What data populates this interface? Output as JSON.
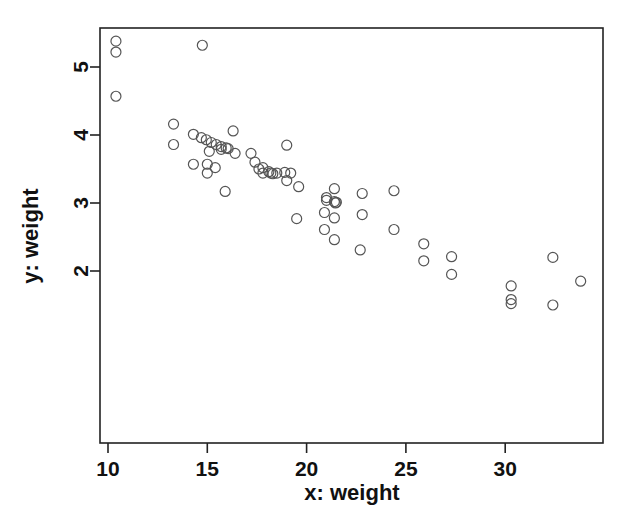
{
  "chart_data": {
    "type": "scatter",
    "title": "",
    "xlabel": "x: weight",
    "ylabel": "y: weight",
    "xlim": [
      9.2,
      34.9
    ],
    "ylim": [
      1.38,
      5.5
    ],
    "xticks": [
      10,
      15,
      20,
      25,
      30
    ],
    "yticks": [
      2,
      3,
      4,
      5
    ],
    "xtick_labels": [
      "10",
      "15",
      "20",
      "25",
      "30"
    ],
    "ytick_labels": [
      "2",
      "3",
      "4",
      "5"
    ],
    "grid": false,
    "legend": null,
    "marker": {
      "shape": "circle-open",
      "size": 5,
      "edge_color": "#555555",
      "fill": "none",
      "line_width": 1.2
    },
    "frame": {
      "box": true,
      "color": "#222222",
      "line_width": 1.6
    },
    "n_points": 63,
    "points": [
      {
        "x": 10.4,
        "y": 5.38
      },
      {
        "x": 10.4,
        "y": 5.22
      },
      {
        "x": 10.4,
        "y": 4.57
      },
      {
        "x": 14.75,
        "y": 5.32
      },
      {
        "x": 13.3,
        "y": 4.16
      },
      {
        "x": 13.3,
        "y": 3.86
      },
      {
        "x": 14.3,
        "y": 4.01
      },
      {
        "x": 14.7,
        "y": 3.96
      },
      {
        "x": 14.95,
        "y": 3.93
      },
      {
        "x": 15.2,
        "y": 3.89
      },
      {
        "x": 15.45,
        "y": 3.86
      },
      {
        "x": 15.7,
        "y": 3.83
      },
      {
        "x": 15.95,
        "y": 3.81
      },
      {
        "x": 16.3,
        "y": 4.06
      },
      {
        "x": 15.1,
        "y": 3.76
      },
      {
        "x": 15.7,
        "y": 3.79
      },
      {
        "x": 16.4,
        "y": 3.73
      },
      {
        "x": 17.2,
        "y": 3.73
      },
      {
        "x": 19.0,
        "y": 3.85
      },
      {
        "x": 14.3,
        "y": 3.57
      },
      {
        "x": 15.0,
        "y": 3.57
      },
      {
        "x": 15.4,
        "y": 3.52
      },
      {
        "x": 15.0,
        "y": 3.44
      },
      {
        "x": 15.9,
        "y": 3.17
      },
      {
        "x": 17.4,
        "y": 3.6
      },
      {
        "x": 17.8,
        "y": 3.52
      },
      {
        "x": 17.8,
        "y": 3.44
      },
      {
        "x": 18.1,
        "y": 3.46
      },
      {
        "x": 18.2,
        "y": 3.44
      },
      {
        "x": 18.5,
        "y": 3.44
      },
      {
        "x": 18.9,
        "y": 3.45
      },
      {
        "x": 19.0,
        "y": 3.33
      },
      {
        "x": 19.6,
        "y": 3.24
      },
      {
        "x": 19.5,
        "y": 2.77
      },
      {
        "x": 21.0,
        "y": 3.08
      },
      {
        "x": 21.0,
        "y": 3.04
      },
      {
        "x": 21.4,
        "y": 3.21
      },
      {
        "x": 21.4,
        "y": 3.02
      },
      {
        "x": 21.5,
        "y": 3.01
      },
      {
        "x": 20.9,
        "y": 2.86
      },
      {
        "x": 21.4,
        "y": 2.78
      },
      {
        "x": 20.9,
        "y": 2.61
      },
      {
        "x": 21.4,
        "y": 2.46
      },
      {
        "x": 22.8,
        "y": 3.14
      },
      {
        "x": 22.8,
        "y": 2.83
      },
      {
        "x": 22.7,
        "y": 2.31
      },
      {
        "x": 24.4,
        "y": 3.18
      },
      {
        "x": 24.4,
        "y": 2.61
      },
      {
        "x": 25.9,
        "y": 2.4
      },
      {
        "x": 25.9,
        "y": 2.15
      },
      {
        "x": 27.3,
        "y": 2.21
      },
      {
        "x": 27.3,
        "y": 1.95
      },
      {
        "x": 30.3,
        "y": 1.78
      },
      {
        "x": 30.3,
        "y": 1.58
      },
      {
        "x": 30.3,
        "y": 1.52
      },
      {
        "x": 32.4,
        "y": 2.2
      },
      {
        "x": 32.4,
        "y": 1.5
      },
      {
        "x": 33.8,
        "y": 1.85
      },
      {
        "x": 18.3,
        "y": 3.43
      },
      {
        "x": 19.2,
        "y": 3.44
      },
      {
        "x": 21.45,
        "y": 3.0
      },
      {
        "x": 17.6,
        "y": 3.5
      },
      {
        "x": 16.05,
        "y": 3.8
      }
    ]
  }
}
